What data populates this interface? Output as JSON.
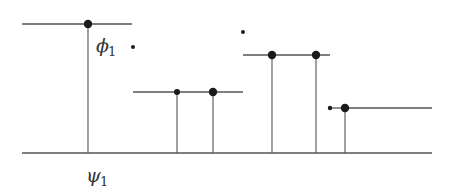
{
  "diagram": {
    "type": "step-function",
    "labels": {
      "phi": "ϕ",
      "phi_sub": "1",
      "psi": "ψ",
      "psi_sub": "1"
    },
    "colors": {
      "line": "#555555",
      "dot": "#1a1a1a"
    }
  }
}
